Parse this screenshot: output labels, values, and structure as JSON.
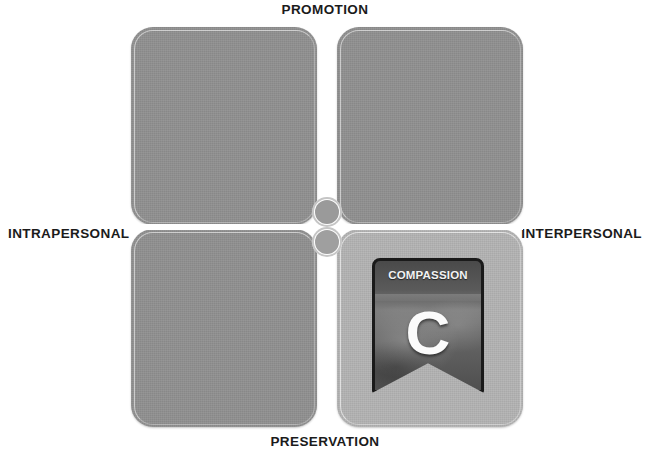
{
  "diagram": {
    "axes": {
      "top": "PROMOTION",
      "bottom": "PRESERVATION",
      "left": "INTRAPERSONAL",
      "right": "INTERPERSONAL"
    },
    "quadrants": [
      {
        "id": "top-left",
        "label": "",
        "highlighted": false,
        "fill": "#919191"
      },
      {
        "id": "top-right",
        "label": "",
        "highlighted": false,
        "fill": "#919191"
      },
      {
        "id": "bottom-left",
        "label": "",
        "highlighted": false,
        "fill": "#919191"
      },
      {
        "id": "bottom-right",
        "label": "",
        "highlighted": true,
        "fill": "#b4b4b4"
      }
    ],
    "badge": {
      "title": "COMPASSION",
      "letter": "C",
      "quadrant": "bottom-right",
      "border_color": "#1a1a1a",
      "text_color": "#f2f2f2"
    },
    "colors": {
      "background": "#ffffff",
      "quadrant_fill": "#919191",
      "quadrant_highlight_fill": "#b4b4b4",
      "label_text": "#1b1b1b"
    }
  }
}
